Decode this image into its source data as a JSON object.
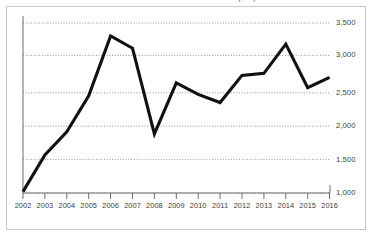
{
  "chart_data": {
    "type": "line",
    "title": "International bond issuance volume ($bn)",
    "xlabel": "",
    "ylabel": "",
    "categories": [
      "2002",
      "2003",
      "2004",
      "2005",
      "2006",
      "2007",
      "2008",
      "2009",
      "2010",
      "2011",
      "2012",
      "2013",
      "2014",
      "2015",
      "2016"
    ],
    "values": [
      1020,
      1560,
      1900,
      2430,
      3310,
      3130,
      1870,
      2620,
      2450,
      2330,
      2730,
      2760,
      3190,
      2550,
      2700
    ],
    "series": [
      {
        "name": "International bond issuance volume",
        "values": [
          1020,
          1560,
          1900,
          2430,
          3310,
          3130,
          1870,
          2620,
          2450,
          2330,
          2730,
          2760,
          3190,
          2550,
          2700
        ]
      }
    ],
    "ylim": [
      1000,
      3500
    ],
    "xlim": [
      "2002",
      "2016"
    ],
    "yticks": [
      1000,
      1500,
      2000,
      2500,
      3000,
      3500
    ],
    "ytick_labels": [
      "1,000",
      "1,500",
      "2,000",
      "2,500",
      "3,000",
      "3,500"
    ],
    "xticks": [
      "2002",
      "2003",
      "2004",
      "2005",
      "2006",
      "2007",
      "2008",
      "2009",
      "2010",
      "2011",
      "2012",
      "2013",
      "2014",
      "2015",
      "2016"
    ],
    "grid": true,
    "grid_style": "dotted-horizontal",
    "legend": false,
    "legend_position": "none",
    "line_color": "#111111",
    "grid_color": "#888888",
    "axis_color": "#6e6e6e",
    "frame_color": "#c8c8c8",
    "background_color": "#ffffff",
    "text_color": "#3d3d3d",
    "annotations": []
  }
}
